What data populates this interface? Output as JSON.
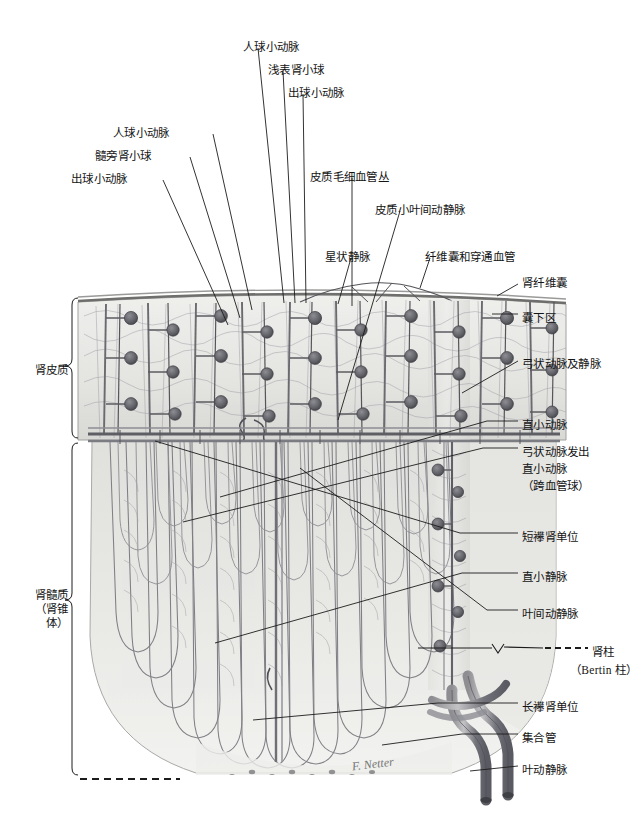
{
  "figure": {
    "signature": "F. Netter",
    "colors": {
      "ink": "#141414",
      "leader": "#1c1c1c",
      "tissue_light": "#e8e8e6",
      "tissue_mid": "#cfcfcc",
      "tissue_dark": "#9a9a97",
      "vessel": "#6e6e72",
      "vessel_dark": "#4a4a50",
      "capsule": "#8a8a88",
      "background": "#ffffff"
    }
  },
  "labels_top": [
    {
      "id": "afferent-arteriole-superficial",
      "text": "人球小动脉",
      "x": 243,
      "y": 40
    },
    {
      "id": "superficial-glomerulus",
      "text": "浅表肾小球",
      "x": 268,
      "y": 63
    },
    {
      "id": "efferent-arteriole-superficial",
      "text": "出球小动脉",
      "x": 288,
      "y": 86
    },
    {
      "id": "afferent-arteriole-juxta",
      "text": "人球小动脉",
      "x": 113,
      "y": 126
    },
    {
      "id": "juxtamedullary-glomerulus",
      "text": "髓旁肾小球",
      "x": 95,
      "y": 149
    },
    {
      "id": "efferent-arteriole-juxta",
      "text": "出球小动脉",
      "x": 71,
      "y": 172
    },
    {
      "id": "cortical-capillary-plexus",
      "text": "皮质毛细血管丛",
      "x": 310,
      "y": 170
    },
    {
      "id": "cortical-interlobular-vessels",
      "text": "皮质小叶间动静脉",
      "x": 375,
      "y": 203
    },
    {
      "id": "stellate-vein",
      "text": "星状静脉",
      "x": 325,
      "y": 250
    },
    {
      "id": "fibrous-capsule-perforating",
      "text": "纤维囊和穿通血管",
      "x": 425,
      "y": 250
    }
  ],
  "labels_right": [
    {
      "id": "renal-fibrous-capsule",
      "text": "肾纤维囊",
      "x": 522,
      "y": 276,
      "lead": {
        "x1": 518,
        "y1": 284,
        "x2": 497,
        "y2": 296
      }
    },
    {
      "id": "subcapsular-zone",
      "text": "囊下区",
      "x": 522,
      "y": 311,
      "lead": {
        "x1": 518,
        "y1": 314,
        "x2": 492,
        "y2": 314
      }
    },
    {
      "id": "arcuate-artery-vein",
      "text": "弓状动脉及静脉",
      "x": 522,
      "y": 357,
      "lead": {
        "x1": 518,
        "y1": 361,
        "x2": 462,
        "y2": 393
      }
    },
    {
      "id": "vasa-recta-arteriole",
      "text": "直小动脉",
      "x": 522,
      "y": 418,
      "lead": {
        "x1": 518,
        "y1": 421,
        "x2": 487,
        "y2": 421
      }
    },
    {
      "id": "arcuate-derived-vasa-recta",
      "text": "弓状动脉发出",
      "x": 522,
      "y": 445,
      "lead": {
        "x1": 518,
        "y1": 448,
        "x2": 483,
        "y2": 448
      }
    },
    {
      "id": "arcuate-derived-vasa-recta-2",
      "text": "直小动脉",
      "x": 522,
      "y": 462
    },
    {
      "id": "arcuate-derived-vasa-recta-3",
      "text": "（跨血管球）",
      "x": 522,
      "y": 479
    },
    {
      "id": "short-loop-nephron",
      "text": "短襻肾单位",
      "x": 522,
      "y": 530,
      "lead": {
        "x1": 518,
        "y1": 533,
        "x2": 460,
        "y2": 533
      }
    },
    {
      "id": "vasa-recta-venule",
      "text": "直小静脉",
      "x": 522,
      "y": 570,
      "lead": {
        "x1": 518,
        "y1": 573,
        "x2": 462,
        "y2": 573
      }
    },
    {
      "id": "interlobar-vessels",
      "text": "叶间动静脉",
      "x": 522,
      "y": 607,
      "lead": {
        "x1": 518,
        "y1": 610,
        "x2": 487,
        "y2": 610
      }
    },
    {
      "id": "renal-column",
      "text": "肾柱",
      "x": 592,
      "y": 645
    },
    {
      "id": "renal-column-bertin",
      "text": "（Bertin 柱）",
      "x": 570,
      "y": 663
    },
    {
      "id": "long-loop-nephron",
      "text": "长襻肾单位",
      "x": 522,
      "y": 700,
      "lead": {
        "x1": 518,
        "y1": 703,
        "x2": 438,
        "y2": 703
      }
    },
    {
      "id": "collecting-duct",
      "text": "集合管",
      "x": 522,
      "y": 731,
      "lead": {
        "x1": 518,
        "y1": 734,
        "x2": 462,
        "y2": 734
      }
    },
    {
      "id": "lobar-artery-vein",
      "text": "叶动静脉",
      "x": 522,
      "y": 763,
      "lead": {
        "x1": 518,
        "y1": 766,
        "x2": 470,
        "y2": 771
      }
    }
  ],
  "labels_left": [
    {
      "id": "renal-cortex",
      "lines": [
        "肾皮质"
      ],
      "x": 22,
      "y": 363
    },
    {
      "id": "renal-medulla",
      "lines": [
        "肾髓质",
        "（肾锥体）"
      ],
      "x": 22,
      "y": 588
    }
  ],
  "brackets": {
    "cortex": {
      "x": 72,
      "y1": 298,
      "y2": 438,
      "tipy": 366
    },
    "medulla": {
      "x": 72,
      "y1": 443,
      "y2": 775,
      "tipy": 600
    }
  },
  "leaders_top": [
    {
      "from": "afferent-arteriole-superficial",
      "x1": 258,
      "y1": 48,
      "x2": 284,
      "y2": 303
    },
    {
      "from": "superficial-glomerulus",
      "x1": 283,
      "y1": 71,
      "x2": 295,
      "y2": 303
    },
    {
      "from": "efferent-arteriole-superficial",
      "x1": 303,
      "y1": 94,
      "x2": 306,
      "y2": 303
    },
    {
      "from": "afferent-arteriole-juxta",
      "x1": 213,
      "y1": 134,
      "x2": 252,
      "y2": 310
    },
    {
      "from": "juxtamedullary-glomerulus",
      "x1": 190,
      "y1": 157,
      "x2": 240,
      "y2": 318
    },
    {
      "from": "efferent-arteriole-juxta",
      "x1": 163,
      "y1": 180,
      "x2": 228,
      "y2": 325
    },
    {
      "from": "cortical-capillary-plexus",
      "x1": 352,
      "y1": 178,
      "x2": 352,
      "y2": 306
    },
    {
      "from": "cortical-interlobular-vessels",
      "x1": 400,
      "y1": 211,
      "x2": 338,
      "y2": 420
    },
    {
      "from": "stellate-vein",
      "x1": 351,
      "y1": 258,
      "x2": 338,
      "y2": 304
    },
    {
      "from": "fibrous-capsule-perforating",
      "x1": 430,
      "y1": 258,
      "x2": 420,
      "y2": 288
    }
  ],
  "leaders_medulla": [
    {
      "id": "vasa-recta-arteriole-lead",
      "x1": 487,
      "y1": 421,
      "x2": 220,
      "y2": 497
    },
    {
      "id": "arcuate-derived-lead",
      "x1": 483,
      "y1": 448,
      "x2": 183,
      "y2": 522
    },
    {
      "id": "short-loop-lead",
      "x1": 460,
      "y1": 533,
      "x2": 155,
      "y2": 441
    },
    {
      "id": "vasa-recta-venule-lead",
      "x1": 462,
      "y1": 573,
      "x2": 215,
      "y2": 643
    },
    {
      "id": "interlobar-lead",
      "x1": 487,
      "y1": 610,
      "x2": 300,
      "y2": 468
    },
    {
      "id": "long-loop-lead",
      "x1": 438,
      "y1": 703,
      "x2": 253,
      "y2": 720
    },
    {
      "id": "collecting-duct-lead",
      "x1": 462,
      "y1": 734,
      "x2": 382,
      "y2": 745
    }
  ],
  "renal_column_marker": {
    "dash_x1": 545,
    "dash_x2": 588,
    "dash_y": 648,
    "v_x": 498,
    "v_y": 648,
    "rule_x1": 418,
    "rule_x2": 492,
    "rule_y": 648
  },
  "bottom_dashes": {
    "x1": 80,
    "x2": 180,
    "y": 779
  }
}
